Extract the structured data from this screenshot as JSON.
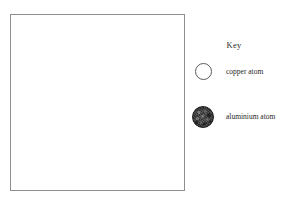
{
  "diagram": {
    "box_name": "empty particle diagram area",
    "border_color": "#8e8e8e",
    "fill_color": "#ffffff"
  },
  "key": {
    "title": "Key",
    "entries": [
      {
        "icon": "open-circle",
        "label": "copper atom",
        "fill_color": "#ffffff",
        "outline_color": "#5a5a5a"
      },
      {
        "icon": "filled-textured-circle",
        "label": "aluminium atom",
        "fill_color": "#3c3c3c",
        "outline_color": "#242424"
      }
    ]
  }
}
